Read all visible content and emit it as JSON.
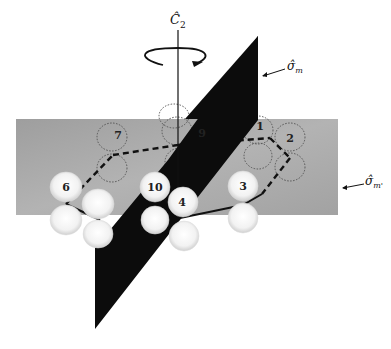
{
  "figure": {
    "symmetry_elements": {
      "axis_label": "Ĉ",
      "axis_subscript": "2",
      "plane_label": "σ̂",
      "plane_subscript": "m",
      "plane2_label": "σ̂",
      "plane2_subscript": "m'"
    },
    "atoms": [
      {
        "id": "1",
        "label": "1"
      },
      {
        "id": "2",
        "label": "2"
      },
      {
        "id": "3",
        "label": "3"
      },
      {
        "id": "4",
        "label": "4"
      },
      {
        "id": "6",
        "label": "6"
      },
      {
        "id": "7",
        "label": "7"
      },
      {
        "id": "9",
        "label": "9"
      },
      {
        "id": "10",
        "label": "10"
      }
    ],
    "colors": {
      "plane_gray": "#a9a9a9",
      "plane_black": "#0c0c0c",
      "lobe_white": "#f7f7f7",
      "bond": "#111111"
    }
  }
}
